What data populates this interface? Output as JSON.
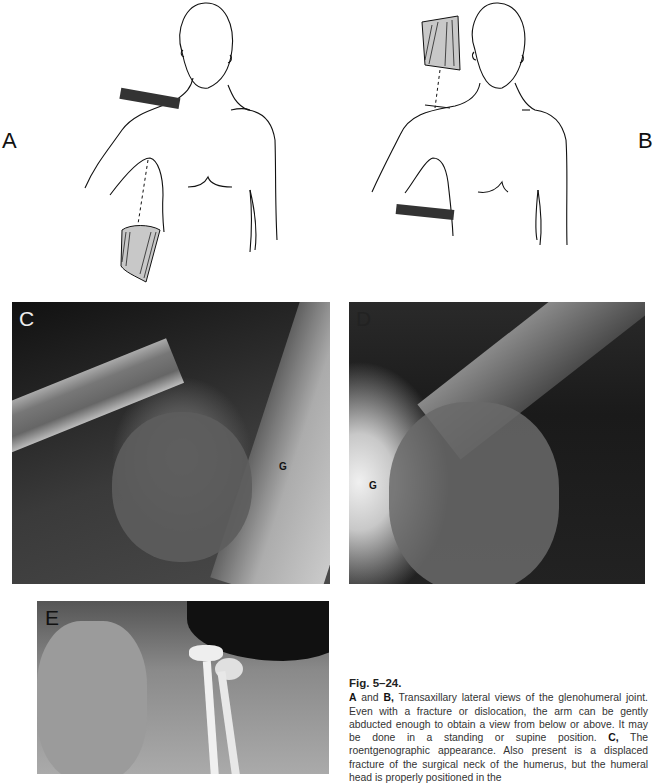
{
  "figure": {
    "number": "Fig. 5–24.",
    "panels": {
      "A": {
        "label": "A",
        "type": "illustration",
        "description": "Patient supine/standing with arm abducted, plate above shoulder, x-ray tube below arm"
      },
      "B": {
        "label": "B",
        "type": "illustration",
        "description": "Patient with arm abducted, x-ray tube above shoulder, plate beneath axilla"
      },
      "C": {
        "label": "C",
        "type": "radiograph",
        "marker": "G"
      },
      "D": {
        "label": "D",
        "type": "radiograph",
        "marker": "G"
      },
      "E": {
        "label": "E",
        "type": "radiograph"
      }
    },
    "caption": {
      "seg1_bold": "A",
      "seg2": " and ",
      "seg3_bold": "B,",
      "seg4": " Transaxillary lateral views of the glenohumeral joint. Even with a fracture or dislocation, the arm can be gently abducted enough to obtain a view from below or above. It may be done in a standing or supine position. ",
      "seg5_bold": "C,",
      "seg6": " The roentgenographic appearance. Also present is a displaced fracture of the surgical neck of the humerus, but the humeral head is properly positioned in the"
    }
  }
}
